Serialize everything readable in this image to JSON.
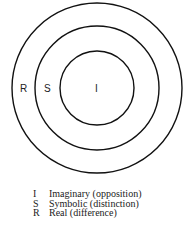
{
  "diagram": {
    "rings": [
      {
        "id": "real",
        "label": "R"
      },
      {
        "id": "symbolic",
        "label": "S"
      },
      {
        "id": "imaginary",
        "label": "I"
      }
    ]
  },
  "legend": [
    {
      "key": "I",
      "text": "Imaginary (opposition)"
    },
    {
      "key": "S",
      "text": "Symbolic (distinction)"
    },
    {
      "key": "R",
      "text": "Real (difference)"
    }
  ]
}
